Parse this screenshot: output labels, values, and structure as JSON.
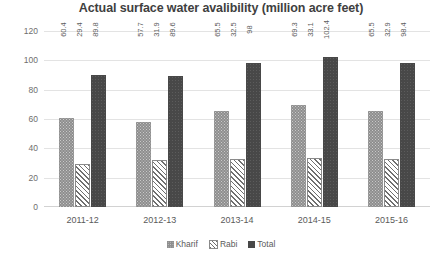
{
  "chart_data": {
    "type": "bar",
    "title": "Actual surface water avalibility (million acre feet)",
    "xlabel": "",
    "ylabel": "",
    "ylim": [
      0,
      120
    ],
    "yticks": [
      0,
      20,
      40,
      60,
      80,
      100,
      120
    ],
    "grid": true,
    "legend_position": "bottom",
    "categories": [
      "2011-12",
      "2012-13",
      "2013-14",
      "2014-15",
      "2015-16"
    ],
    "series": [
      {
        "name": "Kharif",
        "pattern": "dotted",
        "color": "#8e8e8e",
        "values": [
          60.4,
          57.7,
          65.5,
          69.3,
          65.5
        ],
        "labels": [
          "60.4",
          "57.7",
          "65.5",
          "69.3",
          "65.5"
        ]
      },
      {
        "name": "Rabi",
        "pattern": "diagonal-hatch",
        "color": "#6f6f6f",
        "values": [
          29.4,
          31.9,
          32.5,
          33.1,
          32.9
        ],
        "labels": [
          "29.4",
          "31.9",
          "32.5",
          "33.1",
          "32.9"
        ]
      },
      {
        "name": "Total",
        "pattern": "solid",
        "color": "#484848",
        "values": [
          89.8,
          89.6,
          98,
          102.4,
          98.4
        ],
        "labels": [
          "89.8",
          "89.6",
          "98",
          "102.4",
          "98.4"
        ]
      }
    ]
  }
}
